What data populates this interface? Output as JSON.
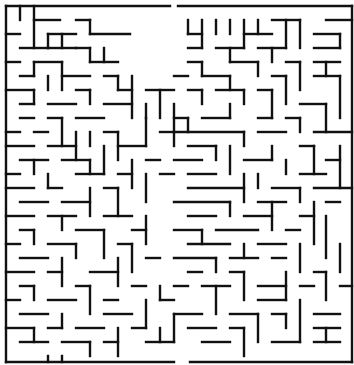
{
  "puzzle": {
    "type": "maze",
    "title": "Maze",
    "entrance": {
      "side": "top",
      "x": 174
    },
    "exit": {
      "side": "bottom",
      "x": 182
    },
    "wall_color": "#111111",
    "background_color": "#ffffff",
    "grid": {
      "origin_x": 6,
      "origin_y": 6,
      "cell": 14.3,
      "cols": 24,
      "rows": 25
    }
  },
  "walls": [
    [
      6,
      6,
      170,
      6
    ],
    [
      178,
      6,
      352,
      6
    ],
    [
      6,
      6,
      6,
      362
    ],
    [
      352,
      6,
      352,
      362
    ],
    [
      6,
      362,
      174,
      362
    ],
    [
      190,
      362,
      352,
      362
    ],
    [
      20,
      6,
      20,
      20
    ],
    [
      34,
      6,
      34,
      48
    ],
    [
      34,
      20,
      60,
      20
    ],
    [
      76,
      20,
      90,
      20
    ],
    [
      90,
      20,
      90,
      34
    ],
    [
      90,
      34,
      130,
      34
    ],
    [
      48,
      34,
      76,
      34
    ],
    [
      6,
      34,
      20,
      34
    ],
    [
      48,
      34,
      48,
      48
    ],
    [
      48,
      48,
      76,
      48
    ],
    [
      62,
      34,
      62,
      48
    ],
    [
      20,
      48,
      48,
      48
    ],
    [
      104,
      48,
      104,
      62
    ],
    [
      76,
      48,
      90,
      48
    ],
    [
      90,
      48,
      90,
      62
    ],
    [
      6,
      62,
      20,
      62
    ],
    [
      34,
      62,
      34,
      76
    ],
    [
      34,
      62,
      62,
      62
    ],
    [
      62,
      62,
      62,
      90
    ],
    [
      20,
      76,
      34,
      76
    ],
    [
      62,
      76,
      90,
      76
    ],
    [
      90,
      62,
      118,
      62
    ],
    [
      6,
      90,
      34,
      90
    ],
    [
      34,
      90,
      34,
      104
    ],
    [
      48,
      76,
      48,
      90
    ],
    [
      48,
      104,
      76,
      104
    ],
    [
      20,
      104,
      34,
      104
    ],
    [
      76,
      90,
      90,
      90
    ],
    [
      90,
      90,
      90,
      104
    ],
    [
      104,
      76,
      118,
      76
    ],
    [
      118,
      76,
      118,
      90
    ],
    [
      118,
      90,
      132,
      90
    ],
    [
      132,
      76,
      132,
      118
    ],
    [
      104,
      104,
      132,
      104
    ],
    [
      20,
      118,
      34,
      118
    ],
    [
      6,
      132,
      20,
      132
    ],
    [
      48,
      118,
      62,
      118
    ],
    [
      62,
      118,
      62,
      146
    ],
    [
      34,
      132,
      48,
      132
    ],
    [
      76,
      118,
      104,
      118
    ],
    [
      90,
      132,
      90,
      146
    ],
    [
      6,
      146,
      34,
      146
    ],
    [
      48,
      146,
      76,
      146
    ],
    [
      76,
      132,
      76,
      160
    ],
    [
      104,
      132,
      118,
      132
    ],
    [
      118,
      132,
      118,
      160
    ],
    [
      20,
      160,
      48,
      160
    ],
    [
      6,
      174,
      20,
      174
    ],
    [
      34,
      160,
      34,
      174
    ],
    [
      62,
      160,
      90,
      160
    ],
    [
      90,
      160,
      90,
      174
    ],
    [
      104,
      146,
      104,
      174
    ],
    [
      118,
      146,
      146,
      146
    ],
    [
      146,
      118,
      146,
      146
    ],
    [
      146,
      90,
      174,
      90
    ],
    [
      160,
      90,
      160,
      118
    ],
    [
      146,
      104,
      146,
      118
    ],
    [
      174,
      104,
      174,
      146
    ],
    [
      160,
      132,
      174,
      132
    ],
    [
      6,
      188,
      34,
      188
    ],
    [
      48,
      174,
      48,
      188
    ],
    [
      48,
      188,
      62,
      188
    ],
    [
      76,
      174,
      104,
      174
    ],
    [
      118,
      174,
      132,
      174
    ],
    [
      132,
      160,
      132,
      188
    ],
    [
      20,
      202,
      48,
      202
    ],
    [
      62,
      202,
      90,
      202
    ],
    [
      90,
      188,
      90,
      216
    ],
    [
      104,
      188,
      118,
      188
    ],
    [
      118,
      188,
      118,
      216
    ],
    [
      146,
      160,
      160,
      160
    ],
    [
      146,
      174,
      146,
      202
    ],
    [
      160,
      174,
      174,
      174
    ],
    [
      6,
      216,
      34,
      216
    ],
    [
      48,
      216,
      76,
      216
    ],
    [
      62,
      216,
      62,
      230
    ],
    [
      104,
      216,
      132,
      216
    ],
    [
      20,
      230,
      34,
      230
    ],
    [
      34,
      230,
      34,
      244
    ],
    [
      76,
      230,
      104,
      230
    ],
    [
      104,
      230,
      104,
      258
    ],
    [
      132,
      230,
      146,
      230
    ],
    [
      146,
      216,
      146,
      244
    ],
    [
      6,
      244,
      20,
      244
    ],
    [
      48,
      244,
      76,
      244
    ],
    [
      76,
      244,
      76,
      258
    ],
    [
      118,
      244,
      132,
      244
    ],
    [
      132,
      244,
      132,
      272
    ],
    [
      20,
      258,
      48,
      258
    ],
    [
      6,
      272,
      34,
      272
    ],
    [
      48,
      272,
      62,
      272
    ],
    [
      62,
      258,
      62,
      286
    ],
    [
      90,
      272,
      118,
      272
    ],
    [
      118,
      258,
      118,
      286
    ],
    [
      146,
      258,
      160,
      258
    ],
    [
      20,
      286,
      34,
      286
    ],
    [
      34,
      286,
      34,
      300
    ],
    [
      76,
      286,
      90,
      286
    ],
    [
      90,
      286,
      90,
      314
    ],
    [
      104,
      300,
      118,
      300
    ],
    [
      132,
      286,
      146,
      286
    ],
    [
      6,
      300,
      20,
      300
    ],
    [
      48,
      300,
      76,
      300
    ],
    [
      62,
      314,
      62,
      328
    ],
    [
      20,
      314,
      48,
      314
    ],
    [
      104,
      314,
      132,
      314
    ],
    [
      146,
      300,
      146,
      328
    ],
    [
      6,
      328,
      34,
      328
    ],
    [
      34,
      328,
      34,
      342
    ],
    [
      48,
      328,
      62,
      328
    ],
    [
      76,
      328,
      104,
      328
    ],
    [
      118,
      328,
      118,
      356
    ],
    [
      132,
      328,
      146,
      328
    ],
    [
      20,
      342,
      48,
      342
    ],
    [
      62,
      342,
      90,
      342
    ],
    [
      90,
      342,
      90,
      356
    ],
    [
      104,
      342,
      118,
      342
    ],
    [
      146,
      342,
      174,
      342
    ],
    [
      160,
      328,
      160,
      342
    ],
    [
      48,
      356,
      48,
      362
    ],
    [
      62,
      356,
      62,
      362
    ],
    [
      174,
      314,
      174,
      342
    ],
    [
      160,
      300,
      174,
      300
    ],
    [
      160,
      286,
      160,
      300
    ],
    [
      188,
      20,
      188,
      34
    ],
    [
      188,
      34,
      202,
      34
    ],
    [
      202,
      20,
      202,
      48
    ],
    [
      216,
      20,
      216,
      34
    ],
    [
      230,
      20,
      230,
      34
    ],
    [
      244,
      20,
      244,
      48
    ],
    [
      244,
      34,
      272,
      34
    ],
    [
      258,
      20,
      258,
      34
    ],
    [
      272,
      20,
      300,
      20
    ],
    [
      286,
      20,
      286,
      48
    ],
    [
      300,
      20,
      300,
      48
    ],
    [
      314,
      34,
      340,
      34
    ],
    [
      326,
      20,
      352,
      20
    ],
    [
      340,
      34,
      340,
      48
    ],
    [
      188,
      48,
      202,
      48
    ],
    [
      216,
      48,
      244,
      48
    ],
    [
      230,
      48,
      230,
      62
    ],
    [
      258,
      48,
      286,
      48
    ],
    [
      272,
      48,
      272,
      62
    ],
    [
      314,
      48,
      340,
      48
    ],
    [
      188,
      62,
      202,
      62
    ],
    [
      202,
      62,
      202,
      76
    ],
    [
      230,
      62,
      258,
      62
    ],
    [
      258,
      62,
      258,
      76
    ],
    [
      286,
      62,
      300,
      62
    ],
    [
      300,
      62,
      300,
      90
    ],
    [
      314,
      62,
      340,
      62
    ],
    [
      326,
      62,
      326,
      76
    ],
    [
      174,
      76,
      188,
      76
    ],
    [
      202,
      76,
      230,
      76
    ],
    [
      230,
      76,
      230,
      90
    ],
    [
      272,
      76,
      286,
      76
    ],
    [
      286,
      76,
      286,
      104
    ],
    [
      314,
      76,
      340,
      76
    ],
    [
      340,
      76,
      340,
      118
    ],
    [
      188,
      90,
      202,
      90
    ],
    [
      202,
      90,
      202,
      104
    ],
    [
      216,
      90,
      244,
      90
    ],
    [
      244,
      90,
      244,
      104
    ],
    [
      258,
      90,
      272,
      90
    ],
    [
      272,
      90,
      272,
      118
    ],
    [
      300,
      104,
      326,
      104
    ],
    [
      326,
      104,
      326,
      132
    ],
    [
      174,
      118,
      188,
      118
    ],
    [
      188,
      118,
      188,
      132
    ],
    [
      202,
      118,
      230,
      118
    ],
    [
      230,
      104,
      230,
      118
    ],
    [
      258,
      118,
      272,
      118
    ],
    [
      286,
      118,
      300,
      118
    ],
    [
      300,
      118,
      300,
      132
    ],
    [
      314,
      132,
      352,
      132
    ],
    [
      174,
      132,
      244,
      132
    ],
    [
      244,
      132,
      244,
      146
    ],
    [
      258,
      132,
      286,
      132
    ],
    [
      188,
      146,
      216,
      146
    ],
    [
      216,
      146,
      216,
      160
    ],
    [
      230,
      146,
      230,
      174
    ],
    [
      272,
      146,
      272,
      160
    ],
    [
      300,
      146,
      314,
      146
    ],
    [
      314,
      146,
      314,
      174
    ],
    [
      174,
      160,
      202,
      160
    ],
    [
      244,
      160,
      272,
      160
    ],
    [
      286,
      160,
      286,
      174
    ],
    [
      326,
      160,
      340,
      160
    ],
    [
      340,
      146,
      340,
      188
    ],
    [
      188,
      174,
      216,
      174
    ],
    [
      258,
      174,
      258,
      188
    ],
    [
      300,
      174,
      326,
      174
    ],
    [
      188,
      188,
      244,
      188
    ],
    [
      244,
      174,
      244,
      202
    ],
    [
      272,
      188,
      300,
      188
    ],
    [
      300,
      188,
      300,
      202
    ],
    [
      314,
      188,
      352,
      188
    ],
    [
      174,
      202,
      230,
      202
    ],
    [
      230,
      202,
      230,
      216
    ],
    [
      258,
      202,
      286,
      202
    ],
    [
      326,
      202,
      340,
      202
    ],
    [
      188,
      216,
      216,
      216
    ],
    [
      244,
      216,
      272,
      216
    ],
    [
      272,
      202,
      272,
      230
    ],
    [
      300,
      216,
      314,
      216
    ],
    [
      314,
      202,
      314,
      244
    ],
    [
      326,
      216,
      326,
      258
    ],
    [
      174,
      230,
      202,
      230
    ],
    [
      202,
      230,
      202,
      244
    ],
    [
      216,
      230,
      258,
      230
    ],
    [
      286,
      230,
      300,
      230
    ],
    [
      188,
      244,
      230,
      244
    ],
    [
      244,
      244,
      244,
      258
    ],
    [
      258,
      244,
      286,
      244
    ],
    [
      300,
      244,
      300,
      272
    ],
    [
      340,
      244,
      340,
      272
    ],
    [
      174,
      258,
      216,
      258
    ],
    [
      216,
      258,
      216,
      272
    ],
    [
      230,
      258,
      258,
      258
    ],
    [
      272,
      258,
      286,
      258
    ],
    [
      314,
      272,
      326,
      272
    ],
    [
      326,
      272,
      326,
      300
    ],
    [
      188,
      272,
      202,
      272
    ],
    [
      230,
      272,
      244,
      272
    ],
    [
      244,
      272,
      244,
      300
    ],
    [
      258,
      286,
      286,
      286
    ],
    [
      286,
      272,
      286,
      300
    ],
    [
      300,
      286,
      314,
      286
    ],
    [
      340,
      286,
      352,
      286
    ],
    [
      174,
      286,
      188,
      286
    ],
    [
      202,
      286,
      230,
      286
    ],
    [
      216,
      286,
      216,
      314
    ],
    [
      258,
      300,
      286,
      300
    ],
    [
      300,
      300,
      300,
      342
    ],
    [
      314,
      314,
      340,
      314
    ],
    [
      174,
      314,
      202,
      314
    ],
    [
      230,
      314,
      258,
      314
    ],
    [
      258,
      314,
      258,
      342
    ],
    [
      272,
      314,
      286,
      314
    ],
    [
      286,
      314,
      286,
      328
    ],
    [
      314,
      328,
      340,
      328
    ],
    [
      326,
      328,
      326,
      342
    ],
    [
      188,
      328,
      216,
      328
    ],
    [
      230,
      328,
      244,
      328
    ],
    [
      244,
      328,
      244,
      356
    ],
    [
      202,
      342,
      230,
      342
    ],
    [
      272,
      342,
      300,
      342
    ],
    [
      314,
      342,
      340,
      342
    ]
  ]
}
